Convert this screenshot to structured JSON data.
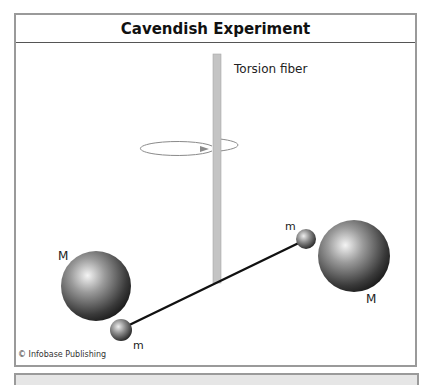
{
  "title": "Cavendish Experiment",
  "labels": {
    "fiber": "Torsion fiber",
    "large_mass_left": "M",
    "large_mass_right": "M",
    "small_mass_left": "m",
    "small_mass_right": "m"
  },
  "credit": "© Infobase Publishing",
  "icons": {
    "rotation": "rotation-arrow-icon"
  },
  "colors": {
    "frame_border": "#9a9a9a",
    "fiber": "#c4c4c4",
    "rod": "#111111",
    "sphere_light": "#f2f2f2",
    "sphere_dark": "#1e1e1e"
  }
}
